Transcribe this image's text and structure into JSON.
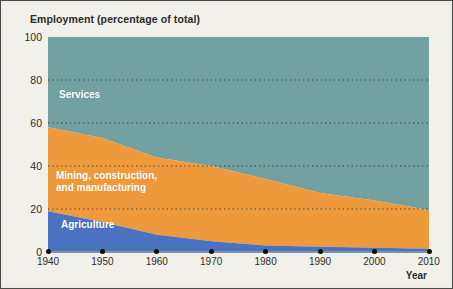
{
  "chart_data": {
    "type": "area",
    "title": "Employment (percentage of total)",
    "xlabel": "Year",
    "ylabel": "",
    "stacked": true,
    "grid": true,
    "legend_position": "inline-labels",
    "xlim": [
      1940,
      2010
    ],
    "ylim": [
      0,
      100
    ],
    "xticks": [
      "1940",
      "1950",
      "1960",
      "1970",
      "1980",
      "1990",
      "2000",
      "2010"
    ],
    "yticks": [
      "0",
      "20",
      "40",
      "60",
      "80",
      "100"
    ],
    "x": [
      1940,
      1950,
      1960,
      1970,
      1980,
      1990,
      2000,
      2010
    ],
    "series": [
      {
        "name": "Agriculture",
        "color": "#4a72c0",
        "values": [
          19,
          14,
          8,
          5,
          3,
          2.5,
          2,
          1.5
        ]
      },
      {
        "name": "Mining, construction,\nand manufacturing",
        "color": "#ee9a3c",
        "values": [
          39,
          39,
          36,
          35,
          31,
          25,
          22,
          18
        ]
      },
      {
        "name": "Services",
        "color": "#73a0a0",
        "values": [
          42,
          47,
          56,
          60,
          66,
          72.5,
          76,
          80.5
        ]
      }
    ],
    "cumulative_tops": {
      "agriculture": [
        19,
        14,
        8,
        5,
        3,
        2.5,
        2,
        1.5
      ],
      "agriculture_plus_mining": [
        58,
        53,
        44,
        40,
        34,
        27.5,
        24,
        19.5
      ],
      "total": [
        100,
        100,
        100,
        100,
        100,
        100,
        100,
        100
      ]
    }
  },
  "labels": {
    "services": "Services",
    "mining": "Mining, construction,\nand manufacturing",
    "agriculture": "Agriculture"
  },
  "colors": {
    "background": "#efede6",
    "plot_background": "#f2f0ea",
    "services": "#73a0a0",
    "mining": "#ee9a3c",
    "agriculture": "#4a72c0",
    "gridline": "#2b3a3a",
    "axis": "#7e93a8",
    "text": "#2b2b2b",
    "border": "#4a4a48"
  }
}
